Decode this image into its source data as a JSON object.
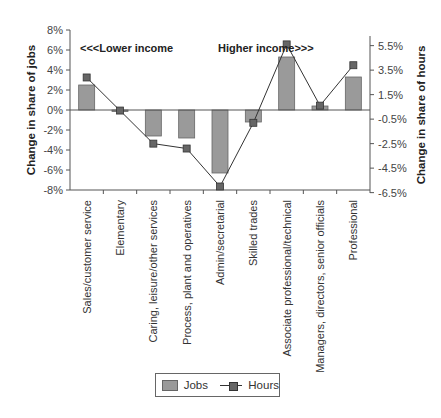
{
  "chart_data": {
    "type": "bar+line",
    "categories": [
      "Sales/customer service",
      "Elementary",
      "Caring, leisure/other services",
      "Process, plant and operatives",
      "Admin/secretarial",
      "Skilled trades",
      "Associate professional/technical",
      "Managers, directors, senior officials",
      "Professional"
    ],
    "series": [
      {
        "name": "Jobs",
        "type": "bar",
        "axis": "left",
        "values": [
          2.5,
          -0.1,
          -2.6,
          -2.8,
          -6.3,
          -1.2,
          5.3,
          0.4,
          3.3
        ]
      },
      {
        "name": "Hours",
        "type": "line",
        "axis": "right",
        "values": [
          2.9,
          0.2,
          -2.5,
          -2.9,
          -6.0,
          -0.8,
          5.6,
          0.6,
          3.9
        ]
      }
    ],
    "left_axis": {
      "label": "Change in share of jobs",
      "ticks": [
        "8%",
        "6%",
        "4%",
        "2%",
        "0%",
        "-2%",
        "-4%",
        "-6%",
        "-8%"
      ],
      "ylim": [
        -8,
        8
      ]
    },
    "right_axis": {
      "label": "Change in share of hours",
      "ticks": [
        "5.5%",
        "3.5%",
        "1.5%",
        "-0.5%",
        "-2.5%",
        "-4.5%",
        "-6.5%"
      ],
      "ylim": [
        -6.5,
        5.5
      ]
    },
    "annotations": [
      "<<<Lower income",
      "Higher income>>>"
    ],
    "legend": {
      "position": "bottom",
      "entries": [
        "Jobs",
        "Hours"
      ]
    },
    "colors": {
      "bar": "#9a9a9a",
      "marker": "#666666",
      "line": "#333333"
    }
  }
}
